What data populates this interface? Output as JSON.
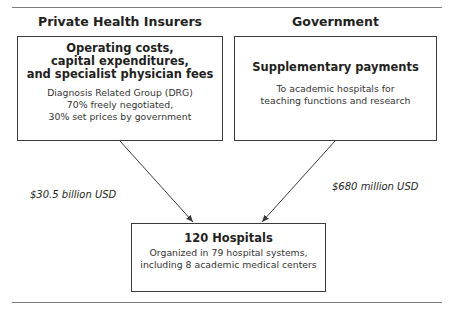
{
  "header": {
    "left_column": "Private Health Insurers",
    "right_column": "Government"
  },
  "boxes": {
    "private": {
      "title_lines": [
        "Operating costs,",
        "capital expenditures,",
        "and specialist physician fees"
      ],
      "body_lines": [
        "Diagnosis Related Group (DRG)",
        "70% freely negotiated,",
        "30% set prices by government"
      ]
    },
    "government": {
      "title": "Supplementary payments",
      "body_lines": [
        "To academic hospitals for",
        "teaching functions and research"
      ]
    },
    "hospitals": {
      "title": "120 Hospitals",
      "body_lines": [
        "Organized in 79 hospital systems,",
        "including 8 academic medical centers"
      ]
    }
  },
  "flows": {
    "private_to_hospitals": "$30.5 billion USD",
    "government_to_hospitals": "$680 million USD"
  },
  "colors": {
    "line": "#3a3a3a",
    "text": "#231f20",
    "rule": "#7a7a7a"
  }
}
